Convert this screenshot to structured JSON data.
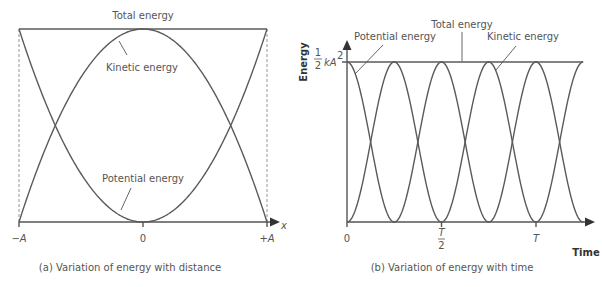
{
  "colors": {
    "line": "#5a5a5a",
    "text": "#555555",
    "background": "#ffffff"
  },
  "chart_data": [
    {
      "type": "line",
      "id": "a",
      "title": "(a) Variation of energy with distance",
      "xlabel": "x",
      "ylabel": "",
      "xticks": [
        "−A",
        "0",
        "+A"
      ],
      "x": [
        -1,
        -0.75,
        -0.5,
        -0.25,
        0,
        0.25,
        0.5,
        0.75,
        1
      ],
      "series": [
        {
          "name": "Total energy",
          "values": [
            1,
            1,
            1,
            1,
            1,
            1,
            1,
            1,
            1
          ]
        },
        {
          "name": "Kinetic energy",
          "values": [
            0,
            0.4375,
            0.75,
            0.9375,
            1,
            0.9375,
            0.75,
            0.4375,
            0
          ]
        },
        {
          "name": "Potential energy",
          "values": [
            1,
            0.5625,
            0.25,
            0.0625,
            0,
            0.0625,
            0.25,
            0.5625,
            1
          ]
        }
      ],
      "annotations": [
        "Total energy",
        "Kinetic energy",
        "Potential energy"
      ],
      "xlim": [
        -1,
        1
      ],
      "ylim": [
        0,
        1
      ],
      "grid": false,
      "dashed_guides_at": [
        -1,
        1
      ]
    },
    {
      "type": "line",
      "id": "b",
      "title": "(b) Variation of energy with time",
      "xlabel": "Time",
      "ylabel": "Energy",
      "xticks": [
        "0",
        "T/2",
        "T"
      ],
      "yticks": [
        "½kA²"
      ],
      "x_unit": "T",
      "x": [
        0,
        0.125,
        0.25,
        0.375,
        0.5,
        0.625,
        0.75,
        0.875,
        1,
        1.125,
        1.25
      ],
      "series": [
        {
          "name": "Total energy",
          "values": [
            1,
            1,
            1,
            1,
            1,
            1,
            1,
            1,
            1,
            1,
            1
          ]
        },
        {
          "name": "Potential energy",
          "values": [
            1,
            0.5,
            0,
            0.5,
            1,
            0.5,
            0,
            0.5,
            1,
            0.5,
            0
          ]
        },
        {
          "name": "Kinetic energy",
          "values": [
            0,
            0.5,
            1,
            0.5,
            0,
            0.5,
            1,
            0.5,
            0,
            0.5,
            1
          ]
        }
      ],
      "annotations": [
        "Total energy",
        "Potential energy",
        "Kinetic energy"
      ],
      "xlim": [
        0,
        1.25
      ],
      "ylim": [
        0,
        1
      ],
      "grid": false
    }
  ],
  "figure_a": {
    "label_total": "Total energy",
    "label_kinetic": "Kinetic energy",
    "label_potential": "Potential energy",
    "tick_neg": "−A",
    "tick_zero": "0",
    "tick_pos": "+A",
    "axis_x": "x",
    "caption": "(a) Variation of energy with distance"
  },
  "figure_b": {
    "label_total": "Total energy",
    "label_potential": "Potential energy",
    "label_kinetic": "Kinetic energy",
    "axis_y": "Energy",
    "ytick_num": "1",
    "ytick_den": "2",
    "ytick_rest": "kA",
    "ytick_sup": "2",
    "tick_zero": "0",
    "tick_half_num": "T",
    "tick_half_den": "2",
    "tick_T": "T",
    "axis_x": "Time",
    "caption": "(b) Variation of energy with time"
  }
}
